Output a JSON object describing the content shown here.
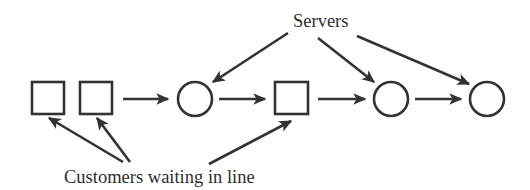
{
  "diagram": {
    "labels": {
      "servers": "Servers",
      "customers": "Customers waiting in line"
    },
    "colors": {
      "ink": "#333333",
      "text": "#2e2e2e",
      "background": "#ffffff"
    },
    "nodes": [
      {
        "id": "customer-1",
        "type": "square",
        "role": "customer waiting in line"
      },
      {
        "id": "customer-2",
        "type": "square",
        "role": "customer waiting in line"
      },
      {
        "id": "server-1",
        "type": "circle",
        "role": "server"
      },
      {
        "id": "customer-3",
        "type": "square",
        "role": "customer waiting in line"
      },
      {
        "id": "server-2",
        "type": "circle",
        "role": "server"
      },
      {
        "id": "server-3",
        "type": "circle",
        "role": "server"
      }
    ],
    "flow": [
      {
        "from": "customer-2",
        "to": "server-1"
      },
      {
        "from": "server-1",
        "to": "customer-3"
      },
      {
        "from": "customer-3",
        "to": "server-2"
      },
      {
        "from": "server-2",
        "to": "server-3"
      }
    ],
    "annotations": [
      {
        "label": "Servers",
        "points_to": [
          "server-1",
          "server-2",
          "server-3"
        ]
      },
      {
        "label": "Customers waiting in line",
        "points_to": [
          "customer-1",
          "customer-2",
          "customer-3"
        ]
      }
    ]
  }
}
